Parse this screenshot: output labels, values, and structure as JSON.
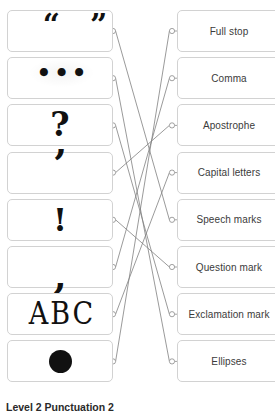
{
  "worksheet": {
    "caption": "Level 2 Punctuation 2",
    "accent_color": "#808080",
    "card_border_color": "#d2d2d2",
    "node_color": "#8a8a8a",
    "text_color": "#3b3b3b",
    "glyph_color": "#111111"
  },
  "left_column": {
    "items": [
      {
        "glyph": "“”",
        "icon_name": "speech-marks-symbol"
      },
      {
        "glyph": "•••",
        "icon_name": "ellipses-symbol"
      },
      {
        "glyph": "?",
        "icon_name": "question-mark-symbol"
      },
      {
        "glyph": "’",
        "icon_name": "apostrophe-symbol"
      },
      {
        "glyph": "!",
        "icon_name": "exclamation-mark-symbol"
      },
      {
        "glyph": ",",
        "icon_name": "comma-symbol"
      },
      {
        "glyph": "ABC",
        "icon_name": "capital-letters-symbol"
      },
      {
        "glyph": "",
        "icon_name": "full-stop-symbol"
      }
    ]
  },
  "right_column": {
    "items": [
      {
        "label": "Full stop"
      },
      {
        "label": "Comma"
      },
      {
        "label": "Apostrophe"
      },
      {
        "label": "Capital letters"
      },
      {
        "label": "Speech marks"
      },
      {
        "label": "Question mark"
      },
      {
        "label": "Exclamation mark"
      },
      {
        "label": "Ellipses"
      }
    ]
  },
  "connections": [
    {
      "from": 0,
      "to": 4
    },
    {
      "from": 1,
      "to": 7
    },
    {
      "from": 2,
      "to": 6
    },
    {
      "from": 3,
      "to": 2
    },
    {
      "from": 4,
      "to": 5
    },
    {
      "from": 5,
      "to": 1
    },
    {
      "from": 6,
      "to": 3
    },
    {
      "from": 7,
      "to": 0
    }
  ],
  "geometry": {
    "card_top_start": 10,
    "card_pitch": 47.2,
    "card_height": 42,
    "left_node_x": 113,
    "right_node_x": 172,
    "node_radius": 2.6
  }
}
